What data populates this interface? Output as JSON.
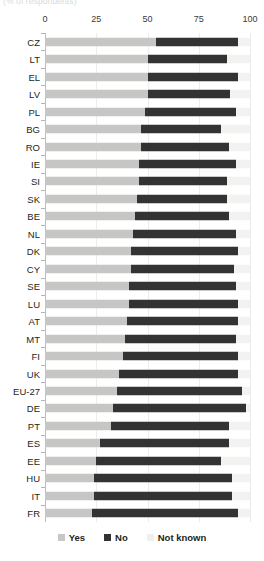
{
  "subtitle": "(% of respondents)",
  "axis": {
    "ticks": [
      0,
      25,
      50,
      75,
      100
    ],
    "tick_labels": [
      "0",
      "25",
      "50",
      "75",
      "100"
    ],
    "min": 0,
    "max": 100
  },
  "legend": {
    "items": [
      {
        "label": "Yes",
        "color": "#c6c6c5",
        "key": "yes"
      },
      {
        "label": "No",
        "color": "#333333",
        "key": "no"
      },
      {
        "label": "Not known",
        "color": "#efefed",
        "key": "not_known"
      }
    ]
  },
  "colors": {
    "yes": "#c6c6c5",
    "no": "#333333",
    "not_known": "#f2f2f0",
    "gridline": "#ececed",
    "axis": "#b5b5b7",
    "text": "#231f20"
  },
  "chart_data": {
    "type": "bar",
    "orientation": "horizontal",
    "stacked": true,
    "title": "",
    "subtitle": "(% of respondents)",
    "xlabel": "",
    "ylabel": "",
    "xlim": [
      0,
      100
    ],
    "grid": true,
    "legend_position": "bottom",
    "categories": [
      "CZ",
      "LT",
      "EL",
      "LV",
      "PL",
      "BG",
      "RO",
      "IE",
      "SI",
      "SK",
      "BE",
      "NL",
      "DK",
      "CY",
      "SE",
      "LU",
      "AT",
      "MT",
      "FI",
      "UK",
      "EU-27",
      "DE",
      "PT",
      "ES",
      "EE",
      "HU",
      "IT",
      "FR"
    ],
    "series": [
      {
        "name": "Yes",
        "values": [
          54,
          50,
          50,
          50,
          49,
          47,
          47,
          46,
          46,
          45,
          44,
          43,
          42,
          42,
          41,
          41,
          40,
          39,
          38,
          36,
          35,
          33,
          32,
          27,
          25,
          24,
          24,
          23
        ]
      },
      {
        "name": "No",
        "values": [
          40,
          39,
          44,
          40,
          44,
          39,
          43,
          47,
          43,
          44,
          46,
          50,
          52,
          50,
          52,
          53,
          54,
          54,
          56,
          58,
          61,
          65,
          58,
          63,
          61,
          67,
          67,
          71
        ]
      },
      {
        "name": "Not known",
        "values": [
          6,
          11,
          6,
          10,
          7,
          14,
          10,
          7,
          11,
          11,
          10,
          7,
          6,
          8,
          7,
          6,
          6,
          7,
          6,
          6,
          4,
          2,
          10,
          10,
          14,
          9,
          9,
          6
        ]
      }
    ]
  }
}
